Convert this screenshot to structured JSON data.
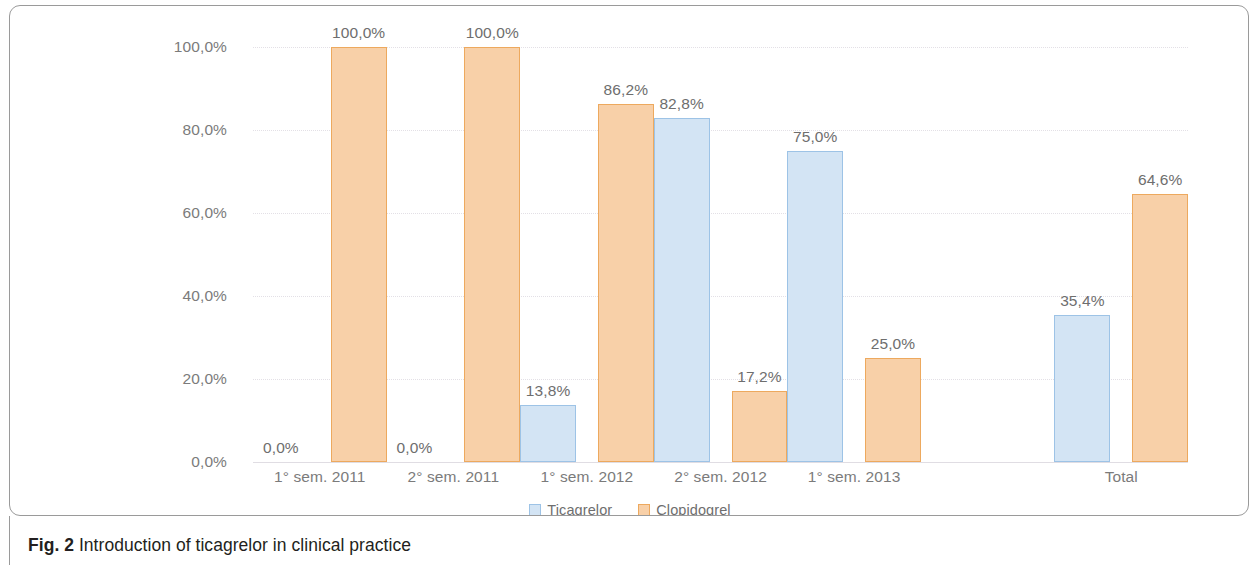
{
  "figure": {
    "caption_label": "Fig. 2",
    "caption_text": "Introduction of ticagrelor in clinical practice"
  },
  "legend": {
    "items": [
      {
        "label": "Ticagrelor",
        "color": "#d3e4f4",
        "border": "#9dc3e6",
        "icon": "legend-swatch-icon"
      },
      {
        "label": "Clopidogrel",
        "color": "#f8d0a8",
        "border": "#eda95e",
        "icon": "legend-swatch-icon"
      }
    ]
  },
  "chart_data": {
    "type": "bar",
    "title": "Introduction of ticagrelor in clinical practice",
    "xlabel": "",
    "ylabel": "",
    "ylim": [
      0,
      100
    ],
    "ytick_labels": [
      "0,0%",
      "20,0%",
      "40,0%",
      "60,0%",
      "80,0%",
      "100,0%"
    ],
    "ytick_values": [
      0,
      20,
      40,
      60,
      80,
      100
    ],
    "grid": true,
    "legend_position": "bottom-center",
    "categories": [
      "1° sem. 2011",
      "2° sem. 2011",
      "1° sem. 2012",
      "2° sem. 2012",
      "1° sem. 2013",
      "",
      "Total"
    ],
    "series": [
      {
        "name": "Ticagrelor",
        "color": "#d3e4f4",
        "values": [
          0.0,
          0.0,
          13.8,
          82.8,
          75.0,
          null,
          35.4
        ],
        "value_labels": [
          "0,0%",
          "0,0%",
          "13,8%",
          "82,8%",
          "75,0%",
          "",
          "35,4%"
        ]
      },
      {
        "name": "Clopidogrel",
        "color": "#f8d0a8",
        "values": [
          100.0,
          100.0,
          86.2,
          17.2,
          25.0,
          null,
          64.6
        ],
        "value_labels": [
          "100,0%",
          "100,0%",
          "86,2%",
          "17,2%",
          "25,0%",
          "",
          "64,6%"
        ]
      }
    ]
  }
}
